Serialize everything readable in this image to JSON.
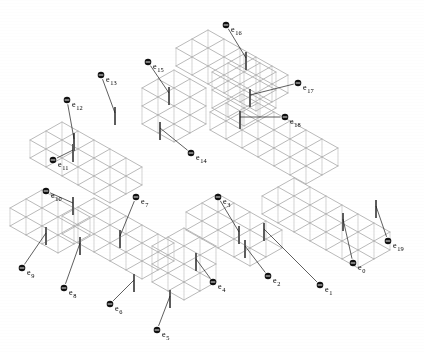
{
  "figure": {
    "type": "isometric-lattice-diagram",
    "title": "",
    "background_color": "#ffffff",
    "line_color": "#a8a8a8",
    "highlight_color": "#5d5d5d",
    "label_color": "#000000",
    "marker_glyph": "circle-with-horizontal-bar",
    "label_prefix": "e",
    "label_count": 20
  },
  "labels": [
    {
      "id": "e0",
      "text": "e",
      "sub": "0",
      "x": 353,
      "y": 263,
      "anchor_x": 343,
      "anchor_y": 219
    },
    {
      "id": "e1",
      "text": "e",
      "sub": "1",
      "x": 320,
      "y": 285,
      "anchor_x": 264,
      "anchor_y": 229
    },
    {
      "id": "e2",
      "text": "e",
      "sub": "2",
      "x": 268,
      "y": 276,
      "anchor_x": 245,
      "anchor_y": 246
    },
    {
      "id": "e3",
      "text": "e",
      "sub": "3",
      "x": 218,
      "y": 197,
      "anchor_x": 239,
      "anchor_y": 232
    },
    {
      "id": "e4",
      "text": "e",
      "sub": "4",
      "x": 213,
      "y": 282,
      "anchor_x": 196,
      "anchor_y": 259
    },
    {
      "id": "e5",
      "text": "e",
      "sub": "5",
      "x": 157,
      "y": 330,
      "anchor_x": 170,
      "anchor_y": 296
    },
    {
      "id": "e6",
      "text": "e",
      "sub": "6",
      "x": 110,
      "y": 304,
      "anchor_x": 134,
      "anchor_y": 280
    },
    {
      "id": "e7",
      "text": "e",
      "sub": "7",
      "x": 136,
      "y": 197,
      "anchor_x": 120,
      "anchor_y": 236
    },
    {
      "id": "e8",
      "text": "e",
      "sub": "8",
      "x": 64,
      "y": 288,
      "anchor_x": 80,
      "anchor_y": 243
    },
    {
      "id": "e9",
      "text": "e",
      "sub": "9",
      "x": 22,
      "y": 268,
      "anchor_x": 46,
      "anchor_y": 233
    },
    {
      "id": "e10",
      "text": "e",
      "sub": "10",
      "x": 46,
      "y": 191,
      "anchor_x": 73,
      "anchor_y": 203
    },
    {
      "id": "e11",
      "text": "e",
      "sub": "11",
      "x": 53,
      "y": 160,
      "anchor_x": 73,
      "anchor_y": 150
    },
    {
      "id": "e12",
      "text": "e",
      "sub": "12",
      "x": 67,
      "y": 100,
      "anchor_x": 74,
      "anchor_y": 139
    },
    {
      "id": "e13",
      "text": "e",
      "sub": "13",
      "x": 101,
      "y": 75,
      "anchor_x": 115,
      "anchor_y": 113
    },
    {
      "id": "e14",
      "text": "e",
      "sub": "14",
      "x": 191,
      "y": 153,
      "anchor_x": 160,
      "anchor_y": 128
    },
    {
      "id": "e15",
      "text": "e",
      "sub": "15",
      "x": 148,
      "y": 62,
      "anchor_x": 169,
      "anchor_y": 93
    },
    {
      "id": "e16",
      "text": "e",
      "sub": "16",
      "x": 226,
      "y": 25,
      "anchor_x": 246,
      "anchor_y": 58
    },
    {
      "id": "e17",
      "text": "e",
      "sub": "17",
      "x": 298,
      "y": 83,
      "anchor_x": 250,
      "anchor_y": 95
    },
    {
      "id": "e18",
      "text": "e",
      "sub": "18",
      "x": 285,
      "y": 117,
      "anchor_x": 240,
      "anchor_y": 117
    },
    {
      "id": "e19",
      "text": "e",
      "sub": "19",
      "x": 388,
      "y": 241,
      "anchor_x": 376,
      "anchor_y": 206
    }
  ],
  "highlighted_edges": [
    {
      "x": 343,
      "y1": 213,
      "y2": 231
    },
    {
      "x": 264,
      "y1": 223,
      "y2": 241
    },
    {
      "x": 245,
      "y1": 240,
      "y2": 258
    },
    {
      "x": 239,
      "y1": 226,
      "y2": 244
    },
    {
      "x": 196,
      "y1": 253,
      "y2": 271
    },
    {
      "x": 170,
      "y1": 290,
      "y2": 308
    },
    {
      "x": 134,
      "y1": 274,
      "y2": 292
    },
    {
      "x": 120,
      "y1": 230,
      "y2": 248
    },
    {
      "x": 80,
      "y1": 237,
      "y2": 255
    },
    {
      "x": 46,
      "y1": 227,
      "y2": 245
    },
    {
      "x": 73,
      "y1": 197,
      "y2": 215
    },
    {
      "x": 73,
      "y1": 144,
      "y2": 162
    },
    {
      "x": 74,
      "y1": 133,
      "y2": 151
    },
    {
      "x": 115,
      "y1": 107,
      "y2": 125
    },
    {
      "x": 160,
      "y1": 122,
      "y2": 140
    },
    {
      "x": 169,
      "y1": 87,
      "y2": 105
    },
    {
      "x": 246,
      "y1": 52,
      "y2": 70
    },
    {
      "x": 250,
      "y1": 89,
      "y2": 107
    },
    {
      "x": 240,
      "y1": 111,
      "y2": 129
    },
    {
      "x": 376,
      "y1": 200,
      "y2": 218
    }
  ],
  "lattice": {
    "cell_width": 16,
    "cell_height_iso": 9,
    "cell_depth": 18,
    "description": "isometric voxel lattice forming a zig-zag snake path",
    "blocks": [
      {
        "name": "top-left-arm",
        "ox": 30,
        "oy": 140,
        "nx": 5,
        "ny": 2,
        "nz": 1
      },
      {
        "name": "upper-riser",
        "ox": 142,
        "oy": 88,
        "nx": 2,
        "ny": 2,
        "nz": 2
      },
      {
        "name": "top-span",
        "ox": 176,
        "oy": 48,
        "nx": 5,
        "ny": 2,
        "nz": 1
      },
      {
        "name": "right-descender",
        "ox": 212,
        "oy": 72,
        "nx": 2,
        "ny": 2,
        "nz": 2
      },
      {
        "name": "right-arm",
        "ox": 210,
        "oy": 112,
        "nx": 6,
        "ny": 2,
        "nz": 1
      },
      {
        "name": "lower-right-arm",
        "ox": 262,
        "oy": 196,
        "nx": 6,
        "ny": 2,
        "nz": 1
      },
      {
        "name": "mid-connector",
        "ox": 186,
        "oy": 212,
        "nx": 4,
        "ny": 2,
        "nz": 1
      },
      {
        "name": "mid-riser",
        "ox": 152,
        "oy": 246,
        "nx": 2,
        "ny": 2,
        "nz": 2
      },
      {
        "name": "left-mid-arm",
        "ox": 62,
        "oy": 216,
        "nx": 5,
        "ny": 2,
        "nz": 1
      },
      {
        "name": "left-riser",
        "ox": 10,
        "oy": 208,
        "nx": 3,
        "ny": 2,
        "nz": 1
      }
    ]
  }
}
